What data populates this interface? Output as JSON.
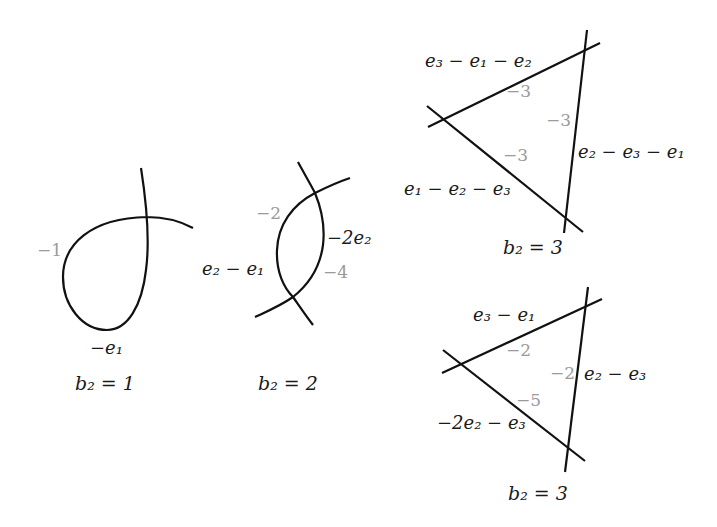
{
  "diagrams": [
    {
      "caption": "b₂ = 1",
      "curve_labels": [
        "−e₁"
      ],
      "self_intersection_labels": [
        "−1"
      ]
    },
    {
      "caption": "b₂ = 2",
      "curve_labels": [
        "e₂ − e₁",
        "−2e₂"
      ],
      "self_intersection_labels": [
        "−2",
        "−4"
      ]
    },
    {
      "caption": "b₂ = 3",
      "curve_labels": [
        "e₃ − e₁ − e₂",
        "e₂ − e₃ − e₁",
        "e₁ − e₂ − e₃"
      ],
      "self_intersection_labels": [
        "−3",
        "−3",
        "−3"
      ]
    },
    {
      "caption": "b₂ = 3",
      "curve_labels": [
        "e₃ − e₁",
        "e₂ − e₃",
        "−2e₂ − e₃"
      ],
      "self_intersection_labels": [
        "−2",
        "−2",
        "−5"
      ]
    }
  ],
  "colors": {
    "stroke": "#111111",
    "curve_label": "#1a1a1a",
    "number_label": "#9a9a9a"
  }
}
